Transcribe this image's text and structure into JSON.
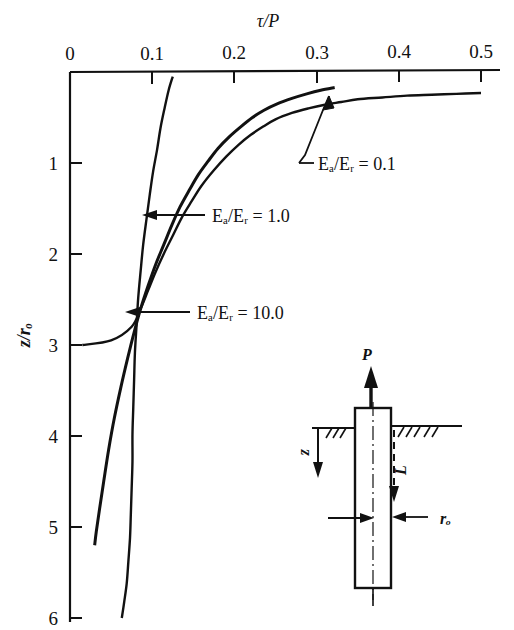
{
  "figure": {
    "kind": "scientific-figure",
    "background_color": "#ffffff",
    "ink_color": "#111111"
  },
  "chart_data": {
    "type": "line",
    "title": "",
    "xlabel": "τ/P",
    "ylabel": "z/rₒ",
    "xlim": [
      0,
      0.5
    ],
    "ylim": [
      6,
      0
    ],
    "x_ticks": [
      0,
      0.1,
      0.2,
      0.3,
      0.4,
      0.5
    ],
    "x_tick_labels": [
      "0",
      "0.1",
      "0.2",
      "0.3",
      "0.4",
      "0.5"
    ],
    "y_ticks": [
      0,
      1,
      2,
      3,
      4,
      5,
      6
    ],
    "y_tick_labels": [
      "0",
      "1",
      "2",
      "3",
      "4",
      "5",
      "6"
    ],
    "x_axis_position": "top",
    "y_axis_position": "left",
    "grid": false,
    "legend": "inline-annotations",
    "series": [
      {
        "name": "Eₐ/Eᵣ = 0.1",
        "label": "Eₐ/Eᵣ = 0.1",
        "points": [
          [
            0.5,
            0.23
          ],
          [
            0.47,
            0.24
          ],
          [
            0.44,
            0.25
          ],
          [
            0.41,
            0.26
          ],
          [
            0.38,
            0.28
          ],
          [
            0.35,
            0.3
          ],
          [
            0.33,
            0.33
          ],
          [
            0.31,
            0.36
          ],
          [
            0.29,
            0.4
          ],
          [
            0.27,
            0.45
          ],
          [
            0.25,
            0.52
          ],
          [
            0.235,
            0.6
          ],
          [
            0.22,
            0.69
          ],
          [
            0.205,
            0.8
          ],
          [
            0.19,
            0.93
          ],
          [
            0.175,
            1.08
          ],
          [
            0.16,
            1.25
          ],
          [
            0.148,
            1.42
          ],
          [
            0.136,
            1.6
          ],
          [
            0.125,
            1.8
          ],
          [
            0.114,
            2.0
          ],
          [
            0.104,
            2.2
          ],
          [
            0.095,
            2.4
          ],
          [
            0.086,
            2.6
          ],
          [
            0.075,
            2.8
          ],
          [
            0.05,
            2.95
          ],
          [
            0.015,
            3.0
          ]
        ]
      },
      {
        "name": "Eₐ/Eᵣ = 1.0",
        "label": "Eₐ/Eᵣ = 1.0",
        "points": [
          [
            0.322,
            0.17
          ],
          [
            0.305,
            0.2
          ],
          [
            0.288,
            0.24
          ],
          [
            0.27,
            0.29
          ],
          [
            0.252,
            0.35
          ],
          [
            0.236,
            0.42
          ],
          [
            0.222,
            0.5
          ],
          [
            0.208,
            0.6
          ],
          [
            0.194,
            0.71
          ],
          [
            0.18,
            0.84
          ],
          [
            0.168,
            0.98
          ],
          [
            0.156,
            1.13
          ],
          [
            0.145,
            1.3
          ],
          [
            0.134,
            1.48
          ],
          [
            0.124,
            1.68
          ],
          [
            0.114,
            1.9
          ],
          [
            0.104,
            2.12
          ],
          [
            0.095,
            2.35
          ],
          [
            0.086,
            2.6
          ],
          [
            0.078,
            2.86
          ],
          [
            0.07,
            3.15
          ],
          [
            0.062,
            3.46
          ],
          [
            0.054,
            3.8
          ],
          [
            0.047,
            4.15
          ],
          [
            0.041,
            4.5
          ],
          [
            0.036,
            4.8
          ],
          [
            0.032,
            5.05
          ],
          [
            0.03,
            5.2
          ]
        ]
      },
      {
        "name": "Eₐ/Eᵣ = 10.0",
        "label": "Eₐ/Eᵣ = 10.0",
        "points": [
          [
            0.125,
            0.05
          ],
          [
            0.12,
            0.2
          ],
          [
            0.115,
            0.4
          ],
          [
            0.11,
            0.62
          ],
          [
            0.106,
            0.85
          ],
          [
            0.101,
            1.1
          ],
          [
            0.097,
            1.35
          ],
          [
            0.093,
            1.62
          ],
          [
            0.089,
            1.9
          ],
          [
            0.086,
            2.18
          ],
          [
            0.083,
            2.48
          ],
          [
            0.081,
            2.78
          ],
          [
            0.079,
            3.08
          ],
          [
            0.078,
            3.38
          ],
          [
            0.077,
            3.68
          ],
          [
            0.076,
            3.98
          ],
          [
            0.076,
            4.28
          ],
          [
            0.075,
            4.58
          ],
          [
            0.074,
            4.86
          ],
          [
            0.073,
            5.12
          ],
          [
            0.071,
            5.38
          ],
          [
            0.069,
            5.62
          ],
          [
            0.066,
            5.82
          ],
          [
            0.063,
            6.0
          ]
        ]
      }
    ],
    "annotations": [
      {
        "text": "Eₐ/Eᵣ = 0.1",
        "leader": "elbow-up",
        "target_point": [
          0.322,
          0.2
        ]
      },
      {
        "text": "Eₐ/Eᵣ = 1.0",
        "leader": "arrow-left",
        "target_point": [
          0.128,
          1.58
        ]
      },
      {
        "text": "Eₐ/Eᵣ = 10.0",
        "leader": "arrow-left",
        "target_point": [
          0.08,
          2.95
        ]
      }
    ]
  },
  "inset_diagram": {
    "name": "pile-schematic",
    "labels": {
      "load": "P",
      "depth": "z",
      "length": "L",
      "radius": "rₒ"
    },
    "elements": [
      "load-arrow-up",
      "pile-rectangle",
      "ground-surface-line",
      "ground-hatching",
      "depth-arrow-down",
      "length-dashed-arrow",
      "radius-dimension-arrows",
      "pile-centerline"
    ]
  }
}
